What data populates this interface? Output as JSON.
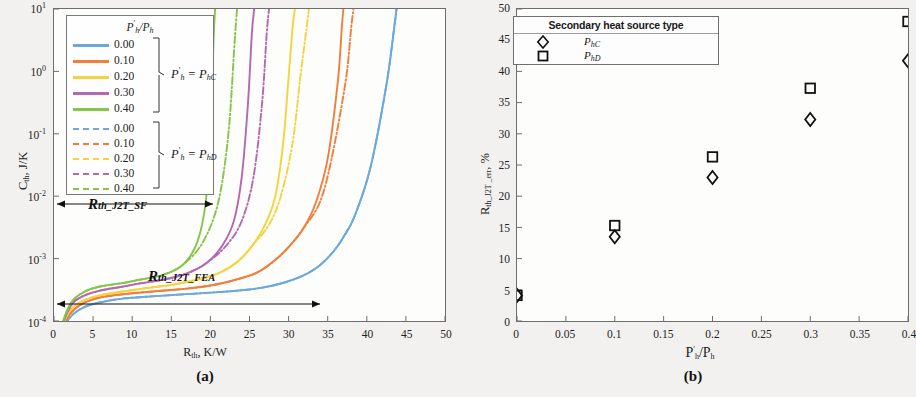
{
  "figure": {
    "panel_a_caption": "(a)",
    "panel_b_caption": "(b)"
  },
  "panel_a": {
    "xlabel_main": "R",
    "xlabel_sub": "th",
    "xlabel_tail": ", K/W",
    "ylabel_main": "C",
    "ylabel_sub": "th",
    "ylabel_tail": ", J/K",
    "xticks": [
      "0",
      "5",
      "10",
      "15",
      "20",
      "25",
      "30",
      "35",
      "40",
      "45",
      "50"
    ],
    "yticks": [
      "10",
      "10",
      "10",
      "10",
      "10",
      "10"
    ],
    "yexps": [
      "1",
      "0",
      "-1",
      "-2",
      "-3",
      "-4"
    ],
    "legend": {
      "title_num": "P",
      "title_prime": "′",
      "title_sub": "h",
      "title_den": "/P",
      "title_den_sub": "h",
      "solid_entries": [
        "0.00",
        "0.10",
        "0.20",
        "0.30",
        "0.40"
      ],
      "dash_entries": [
        "0.00",
        "0.10",
        "0.20",
        "0.30",
        "0.40"
      ],
      "group_solid": "P′h = PhC",
      "group_dash": "P′h = PhD",
      "group_solid_parts": {
        "lead": "P",
        "prime": "′",
        "sub": "h",
        "eq": " = P",
        "sub2": "hC"
      },
      "group_dash_parts": {
        "lead": "P",
        "prime": "′",
        "sub": "h",
        "eq": " = P",
        "sub2": "hD"
      }
    },
    "annotations": [
      {
        "label": "R",
        "sub": "th_J2T_SF",
        "x_start": 0.5,
        "x_end": 20.3
      },
      {
        "label": "R",
        "sub": "th_J2T_FEA",
        "x_start": 0.5,
        "x_end": 34.0
      }
    ]
  },
  "panel_b": {
    "xlabel_main": "P",
    "xlabel_prime": "′",
    "xlabel_sub": "h",
    "xlabel_den": "/P",
    "xlabel_den_sub": "h",
    "ylabel_main": "R",
    "ylabel_sub": "th_J2T _err",
    "ylabel_tail": ", %",
    "xticks": [
      "0",
      "0.05",
      "0.1",
      "0.15",
      "0.2",
      "0.25",
      "0.3",
      "0.35",
      "0.4"
    ],
    "yticks": [
      "0",
      "5",
      "10",
      "15",
      "20",
      "25",
      "30",
      "35",
      "40",
      "45",
      "50"
    ],
    "legend": {
      "title": "Secondary heat source type",
      "entries": [
        {
          "marker": "diamond",
          "label": "PhC",
          "lead": "P",
          "sub": "hC"
        },
        {
          "marker": "square",
          "label": "PhD",
          "lead": "P",
          "sub": "hD"
        }
      ]
    }
  },
  "colors": {
    "c000": "#6aa9dc",
    "c010": "#f07f3c",
    "c020": "#f5d33f",
    "c030": "#b568b0",
    "c040": "#86c44a",
    "axis": "#6d6d6d",
    "text": "#1a1a1a",
    "background": "#f2f1ef",
    "plot_bg": "#fdfdfc"
  },
  "chart_data": [
    {
      "type": "line",
      "panel": "a",
      "title": "",
      "xlabel": "R_th, K/W",
      "ylabel": "C_th, J/K",
      "xlim": [
        0,
        50
      ],
      "ylim_log": [
        0.0001,
        10
      ],
      "yscale": "log",
      "grid": false,
      "legend_position": "top-left-inset",
      "series": [
        {
          "name": "P'h/Ph = 0.00, P'h = PhC",
          "style": "solid",
          "color": "#6aa9dc",
          "x": [
            0.5,
            1,
            1.6,
            2.5,
            4,
            6,
            9,
            13,
            17,
            21,
            25,
            28,
            31,
            33.5,
            35.5,
            37,
            38.5,
            40.5,
            42.5,
            43.5,
            43.8
          ],
          "y": [
            3.15e-05,
            6e-05,
            9.5e-05,
            0.00013,
            0.00017,
            0.0002,
            0.00023,
            0.00025,
            0.00027,
            0.00029,
            0.00032,
            0.00037,
            0.00048,
            0.0007,
            0.0012,
            0.0022,
            0.005,
            0.03,
            0.6,
            5,
            10
          ]
        },
        {
          "name": "P'h/Ph = 0.00, P'h = PhD",
          "style": "dashdot",
          "color": "#6aa9dc",
          "x": [
            0.5,
            1,
            1.6,
            2.5,
            4,
            6,
            9,
            13,
            17,
            21,
            25,
            28,
            31,
            33.5,
            35.5,
            37,
            38.5,
            40.5,
            42.5,
            43.5,
            43.8
          ],
          "y": [
            3.15e-05,
            6e-05,
            9.5e-05,
            0.00013,
            0.00017,
            0.0002,
            0.00023,
            0.00025,
            0.00027,
            0.00029,
            0.00032,
            0.00037,
            0.00048,
            0.0007,
            0.0012,
            0.0022,
            0.005,
            0.03,
            0.6,
            5,
            10
          ]
        },
        {
          "name": "P'h/Ph = 0.10, P'h = PhC",
          "style": "solid",
          "color": "#f07f3c",
          "x": [
            0.5,
            1,
            1.6,
            2.5,
            4,
            6,
            9,
            13,
            17,
            20,
            23,
            26,
            28.5,
            30.5,
            32,
            33.5,
            35,
            36.3,
            36.8,
            37
          ],
          "y": [
            3.15e-05,
            6.5e-05,
            0.000105,
            0.00015,
            0.0002,
            0.00024,
            0.00027,
            0.0003,
            0.00033,
            0.00037,
            0.00045,
            0.0006,
            0.001,
            0.0018,
            0.0032,
            0.008,
            0.04,
            0.7,
            5,
            10
          ]
        },
        {
          "name": "P'h/Ph = 0.10, P'h = PhD",
          "style": "dashdot",
          "color": "#f07f3c",
          "x": [
            0.5,
            1,
            1.6,
            2.5,
            4,
            6,
            9,
            13,
            17,
            20,
            23,
            26,
            28.5,
            30.5,
            32,
            34,
            35.5,
            37.3,
            38,
            38.3
          ],
          "y": [
            3.15e-05,
            6.5e-05,
            0.000105,
            0.00015,
            0.0002,
            0.00024,
            0.00027,
            0.0003,
            0.00033,
            0.00037,
            0.00045,
            0.0006,
            0.001,
            0.0018,
            0.0032,
            0.008,
            0.04,
            0.7,
            5,
            10
          ]
        },
        {
          "name": "P'h/Ph = 0.20, P'h = PhC",
          "style": "solid",
          "color": "#f5d33f",
          "x": [
            0.5,
            1,
            1.6,
            2.5,
            4,
            6,
            9,
            12,
            15,
            18,
            21,
            23.5,
            25.5,
            27,
            28.3,
            29.3,
            30,
            30.5,
            30.8
          ],
          "y": [
            3.15e-05,
            7e-05,
            0.00012,
            0.00017,
            0.00022,
            0.00026,
            0.0003,
            0.00034,
            0.00038,
            0.00045,
            0.00058,
            0.0009,
            0.0017,
            0.0035,
            0.01,
            0.07,
            0.8,
            5,
            10
          ]
        },
        {
          "name": "P'h/Ph = 0.20, P'h = PhD",
          "style": "dashdot",
          "color": "#f5d33f",
          "x": [
            0.5,
            1,
            1.6,
            2.5,
            4,
            6,
            9,
            12,
            15,
            18,
            21,
            23.5,
            25.5,
            27.5,
            29,
            30.5,
            31.5,
            32.3,
            32.6
          ],
          "y": [
            3.15e-05,
            7e-05,
            0.00012,
            0.00017,
            0.00022,
            0.00026,
            0.0003,
            0.00034,
            0.00038,
            0.00045,
            0.00058,
            0.0009,
            0.0017,
            0.0035,
            0.01,
            0.07,
            0.8,
            5,
            10
          ]
        },
        {
          "name": "P'h/Ph = 0.30, P'h = PhC",
          "style": "solid",
          "color": "#b568b0",
          "x": [
            0.5,
            1,
            1.6,
            2.5,
            4,
            6,
            8.5,
            11,
            14,
            17,
            19.5,
            21.5,
            23,
            24,
            24.8,
            25.3,
            25.6
          ],
          "y": [
            3.15e-05,
            7.5e-05,
            0.00013,
            0.0002,
            0.00026,
            0.00031,
            0.00035,
            0.0004,
            0.00046,
            0.00058,
            0.00085,
            0.0016,
            0.004,
            0.02,
            0.3,
            4,
            10
          ]
        },
        {
          "name": "P'h/Ph = 0.30, P'h = PhD",
          "style": "dashdot",
          "color": "#b568b0",
          "x": [
            0.5,
            1,
            1.6,
            2.5,
            4,
            6,
            8.5,
            11,
            14,
            17,
            19.5,
            22,
            24,
            25.5,
            26.6,
            27.2,
            27.5
          ],
          "y": [
            3.15e-05,
            7.5e-05,
            0.00013,
            0.0002,
            0.00026,
            0.00031,
            0.00035,
            0.0004,
            0.00046,
            0.00058,
            0.00085,
            0.0016,
            0.004,
            0.02,
            0.3,
            4,
            10
          ]
        },
        {
          "name": "P'h/Ph = 0.40, P'h = PhC",
          "style": "solid",
          "color": "#86c44a",
          "x": [
            0.5,
            1,
            1.6,
            2.5,
            4,
            6,
            8.5,
            11,
            14,
            16.5,
            18.3,
            19.4,
            20,
            20.4,
            20.6
          ],
          "y": [
            3.15e-05,
            8e-05,
            0.00014,
            0.00022,
            0.0003,
            0.00036,
            0.0004,
            0.00046,
            0.00055,
            0.0008,
            0.0018,
            0.008,
            0.1,
            3,
            10
          ]
        },
        {
          "name": "P'h/Ph = 0.40, P'h = PhD",
          "style": "dashdot",
          "color": "#86c44a",
          "x": [
            0.5,
            1,
            1.6,
            2.5,
            4,
            6,
            8.5,
            11,
            14,
            16.5,
            19,
            21,
            22.3,
            23.1,
            23.4
          ],
          "y": [
            3.15e-05,
            8e-05,
            0.00014,
            0.00022,
            0.0003,
            0.00036,
            0.0004,
            0.00046,
            0.00055,
            0.0008,
            0.0018,
            0.008,
            0.1,
            3,
            10
          ]
        }
      ]
    },
    {
      "type": "scatter",
      "panel": "b",
      "title": "",
      "xlabel": "P'h/Ph",
      "ylabel": "R_th_J2T_err, %",
      "xlim": [
        0,
        0.4
      ],
      "ylim": [
        0,
        50
      ],
      "xticks": [
        0,
        0.05,
        0.1,
        0.15,
        0.2,
        0.25,
        0.3,
        0.35,
        0.4
      ],
      "yticks": [
        0,
        5,
        10,
        15,
        20,
        25,
        30,
        35,
        40,
        45,
        50
      ],
      "grid": false,
      "legend_position": "top-left-inset",
      "series": [
        {
          "name": "PhC",
          "marker": "diamond",
          "x": [
            0,
            0.1,
            0.2,
            0.3,
            0.4
          ],
          "y": [
            4.1,
            13.5,
            23.0,
            32.3,
            41.7
          ]
        },
        {
          "name": "PhD",
          "marker": "square",
          "x": [
            0,
            0.1,
            0.2,
            0.3,
            0.4
          ],
          "y": [
            4.1,
            15.3,
            26.3,
            37.3,
            48.0
          ]
        }
      ]
    }
  ]
}
